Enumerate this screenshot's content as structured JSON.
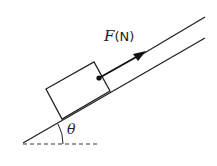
{
  "diagram": {
    "type": "inclined-plane-force",
    "force_label": {
      "variable": "F",
      "unit": "(N)"
    },
    "angle_label": "θ",
    "colors": {
      "line": "#222222",
      "background": "#ffffff"
    }
  }
}
